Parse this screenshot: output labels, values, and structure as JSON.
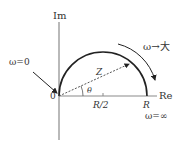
{
  "diagram": {
    "type": "impedance-locus",
    "axes": {
      "imag_label": "Im",
      "real_label": "Re",
      "origin_label": "0"
    },
    "ticks": {
      "half_r": "R/2",
      "r": "R"
    },
    "vector": {
      "label": "Z",
      "angle_label": "θ"
    },
    "annotations": {
      "omega_zero": "ω=0",
      "omega_inf": "ω=∞",
      "omega_increase": "ω→大"
    },
    "colors": {
      "axis": "#8a8a8a",
      "curve": "#222222",
      "text": "#333333"
    }
  }
}
